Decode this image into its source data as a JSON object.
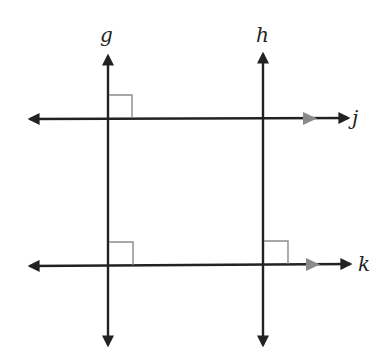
{
  "diagram": {
    "type": "parallel and perpendicular lines",
    "lines": [
      {
        "name": "g",
        "orientation": "vertical",
        "label": "g"
      },
      {
        "name": "h",
        "orientation": "vertical",
        "label": "h"
      },
      {
        "name": "j",
        "orientation": "horizontal",
        "label": "j",
        "parallel_marker": true
      },
      {
        "name": "k",
        "orientation": "horizontal",
        "label": "k",
        "parallel_marker": true
      }
    ],
    "right_angles": [
      {
        "at": "g ∩ j"
      },
      {
        "at": "g ∩ k"
      },
      {
        "at": "h ∩ k"
      }
    ],
    "colors": {
      "line": "#222222",
      "marker": "#8a8a8a"
    }
  }
}
